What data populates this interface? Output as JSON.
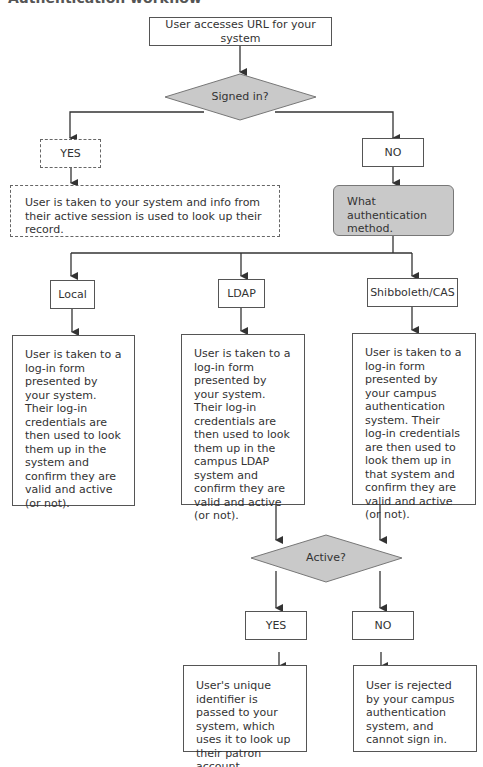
{
  "title": "Authentication workflow",
  "nodes": {
    "start": "User accesses URL for your system",
    "signed_in": "Signed in?",
    "yes1": "YES",
    "no1": "NO",
    "yes_result": "User is taken to your system and info from their active session is used to look up their record.",
    "method": "What authentication method.",
    "local": "Local",
    "ldap": "LDAP",
    "shib": "Shibboleth/CAS",
    "local_desc": "User is taken to a log-in form presented by your system. Their log-in credentials are then used to look them up in the system and confirm they are valid and active (or not).",
    "ldap_desc": "User is taken to a log-in form presented by your system. Their log-in credentials are then used to look them up in the campus LDAP system and confirm they are valid and active (or not).",
    "shib_desc": "User is taken to a log-in form presented by your campus authentication system. Their log-in credentials are then used to look them up in that system and confirm they are valid and active (or not).",
    "active": "Active?",
    "yes2": "YES",
    "no2": "NO",
    "yes2_result": "User's unique identifier is passed to your system, which uses it to look up their patron account.",
    "no2_result": "User is rejected by your campus authentication system, and cannot sign in."
  },
  "colors": {
    "decision_fill": "#c9c9c9",
    "line": "#333333"
  }
}
